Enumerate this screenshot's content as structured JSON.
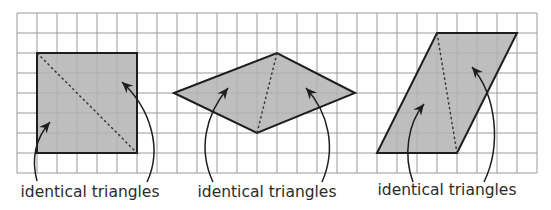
{
  "figure": {
    "grid": {
      "origin_x": 17,
      "origin_y": 13,
      "cell_size": 20,
      "columns": 26,
      "rows": 8,
      "line_color": "#9a9a9a"
    },
    "colors": {
      "shape_fill": "#b3b3b3",
      "shape_stroke": "#1e1e1e",
      "text": "#2b2b2b"
    },
    "panels": [
      {
        "shape": "square",
        "label": "identical triangles",
        "vertices": [
          [
            37,
            53
          ],
          [
            137,
            53
          ],
          [
            137,
            153
          ],
          [
            37,
            153
          ]
        ],
        "diagonal": [
          [
            37,
            53
          ],
          [
            137,
            153
          ]
        ],
        "arrows": [
          {
            "path": "M 37 181 C 31 158, 36 138, 50 122",
            "tip": [
              50,
              122
            ],
            "dir": [
              0.65,
              -0.76
            ]
          },
          {
            "path": "M 147 182 C 163 148, 150 108, 122 82",
            "tip": [
              122,
              82
            ],
            "dir": [
              -0.73,
              -0.68
            ]
          }
        ],
        "label_pos": [
          90,
          197
        ]
      },
      {
        "shape": "rhombus",
        "label": "identical triangles",
        "vertices": [
          [
            174,
            93
          ],
          [
            277,
            53
          ],
          [
            355,
            93
          ],
          [
            257,
            133
          ]
        ],
        "diagonal": [
          [
            277,
            53
          ],
          [
            257,
            133
          ]
        ],
        "arrows": [
          {
            "path": "M 213 182 C 198 150, 205 115, 228 88",
            "tip": [
              228,
              88
            ],
            "dir": [
              0.62,
              -0.78
            ]
          },
          {
            "path": "M 322 182 C 337 148, 328 112, 306 88",
            "tip": [
              306,
              88
            ],
            "dir": [
              -0.67,
              -0.74
            ]
          }
        ],
        "label_pos": [
          267,
          197
        ]
      },
      {
        "shape": "parallelogram",
        "label": "identical triangles",
        "vertices": [
          [
            437,
            33
          ],
          [
            517,
            33
          ],
          [
            457,
            153
          ],
          [
            377,
            153
          ]
        ],
        "diagonal": [
          [
            437,
            33
          ],
          [
            457,
            153
          ]
        ],
        "arrows": [
          {
            "path": "M 413 182 C 403 155, 408 123, 424 104",
            "tip": [
              424,
              104
            ],
            "dir": [
              0.62,
              -0.78
            ]
          },
          {
            "path": "M 484 182 C 502 145, 496 95, 472 67",
            "tip": [
              472,
              67
            ],
            "dir": [
              -0.65,
              -0.76
            ]
          }
        ],
        "label_pos": [
          447,
          195
        ]
      }
    ]
  }
}
